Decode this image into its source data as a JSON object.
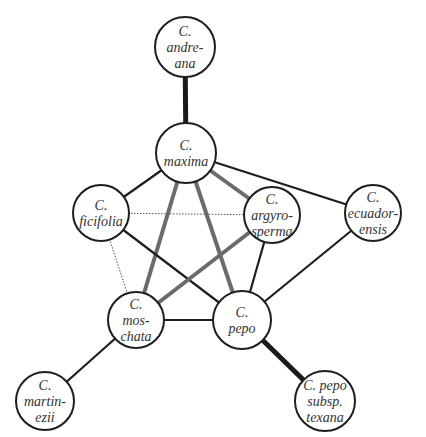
{
  "diagram": {
    "type": "network",
    "nodes": [
      {
        "id": "andreana",
        "lines": [
          "C.",
          "andre-",
          "ana"
        ],
        "x": 185,
        "y": 47,
        "r": 30
      },
      {
        "id": "maxima",
        "lines": [
          "C.",
          "maxima"
        ],
        "x": 186,
        "y": 153,
        "r": 30
      },
      {
        "id": "ficifolia",
        "lines": [
          "C.",
          "ficifolia"
        ],
        "x": 101,
        "y": 213,
        "r": 28
      },
      {
        "id": "argyrosperma",
        "lines": [
          "C.",
          "argyro-",
          "sperma"
        ],
        "x": 272,
        "y": 215,
        "r": 28
      },
      {
        "id": "ecuadorensis",
        "lines": [
          "C.",
          "ecuador-",
          "ensis"
        ],
        "x": 373,
        "y": 213,
        "r": 28
      },
      {
        "id": "moschata",
        "lines": [
          "C.",
          "mos-",
          "chata"
        ],
        "x": 136,
        "y": 320,
        "r": 28
      },
      {
        "id": "pepo",
        "lines": [
          "C.",
          "pepo"
        ],
        "x": 242,
        "y": 320,
        "r": 29
      },
      {
        "id": "martinezii",
        "lines": [
          "C.",
          "martin-",
          "ezii"
        ],
        "x": 45,
        "y": 401,
        "r": 29
      },
      {
        "id": "texana",
        "lines": [
          "C. pepo",
          "subsp.",
          "texana"
        ],
        "x": 325,
        "y": 401,
        "r": 30
      }
    ],
    "edges": [
      {
        "from": "andreana",
        "to": "maxima",
        "style": "thick-black"
      },
      {
        "from": "maxima",
        "to": "ficifolia",
        "style": "black"
      },
      {
        "from": "maxima",
        "to": "ecuadorensis",
        "style": "black"
      },
      {
        "from": "maxima",
        "to": "argyrosperma",
        "style": "gray"
      },
      {
        "from": "maxima",
        "to": "moschata",
        "style": "gray"
      },
      {
        "from": "maxima",
        "to": "pepo",
        "style": "gray"
      },
      {
        "from": "ficifolia",
        "to": "argyrosperma",
        "style": "dotted"
      },
      {
        "from": "ficifolia",
        "to": "moschata",
        "style": "dotted"
      },
      {
        "from": "ficifolia",
        "to": "pepo",
        "style": "black"
      },
      {
        "from": "argyrosperma",
        "to": "moschata",
        "style": "gray"
      },
      {
        "from": "argyrosperma",
        "to": "pepo",
        "style": "black"
      },
      {
        "from": "ecuadorensis",
        "to": "pepo",
        "style": "black"
      },
      {
        "from": "moschata",
        "to": "pepo",
        "style": "black"
      },
      {
        "from": "moschata",
        "to": "martinezii",
        "style": "black"
      },
      {
        "from": "pepo",
        "to": "texana",
        "style": "thick-black"
      }
    ],
    "edge_styles": {
      "black": {
        "color": "#1e1e1e",
        "width": 2.2
      },
      "thick-black": {
        "color": "#1a1a1a",
        "width": 5
      },
      "gray": {
        "color": "#6b6b6b",
        "width": 4
      },
      "dotted": {
        "color": "#555555",
        "width": 1,
        "dash": "1.5,1.5"
      }
    }
  }
}
